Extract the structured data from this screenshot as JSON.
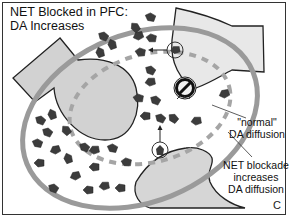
{
  "figure": {
    "title_line1": "NET Blocked in PFC:",
    "title_line2": "DA Increases",
    "panel_letter": "C"
  },
  "labels": {
    "normal_line1": "\"normal\"",
    "normal_line2": "DA diffusion",
    "blockade_line1": "NET blockade",
    "blockade_line2": "increases",
    "blockade_line3": "DA diffusion"
  },
  "colors": {
    "cell_fill": "#d2d2d2",
    "cell_fill_light": "#e6e6e6",
    "large_ring": "#9a9a9a",
    "dashed_ring": "#a5a5a5",
    "dopamine": "#3c3c3c",
    "outline": "#222222"
  },
  "legend_semantics": {
    "large_ring": "NET blockade increases DA diffusion",
    "dashed_ring": "\"normal\" DA diffusion",
    "blocked_transporter": "blocked NET"
  }
}
